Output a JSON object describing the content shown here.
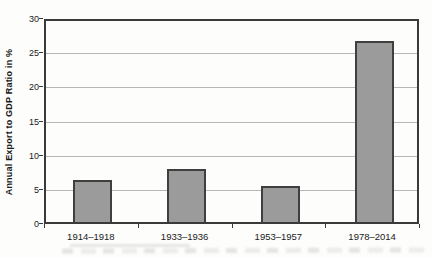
{
  "chart_data": {
    "type": "bar",
    "title": "",
    "xlabel": "",
    "ylabel": "Annual Export to GDP Ratio in %",
    "categories": [
      "1914–1918",
      "1933–1936",
      "1953–1957",
      "1978–2014"
    ],
    "values": [
      6.2,
      7.7,
      5.3,
      26.5
    ],
    "ylim": [
      0,
      30
    ],
    "yticks": [
      0,
      5,
      10,
      15,
      20,
      25,
      30
    ],
    "grid": true,
    "legend": false,
    "colors": {
      "bar_fill": "#9b9b9b",
      "bar_border": "#3f3f3f",
      "grid_color": "#b7b7b7",
      "axis_color": "#3a3a3a",
      "text_color": "#1a1a1a",
      "background": "#fdfdfc"
    }
  }
}
